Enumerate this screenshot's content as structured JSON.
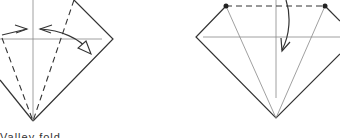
{
  "diagram": {
    "type": "origami-instructions",
    "colors": {
      "line": "#333333",
      "crease": "#888888",
      "background": "#ffffff",
      "point": "#222222"
    },
    "steps": [
      {
        "id": "step-left",
        "description": "Fold both sides to center (valley folds, arrows showing fold directions)"
      },
      {
        "id": "step-right",
        "description": "Fold top down along dashed line between marked points"
      }
    ],
    "caption_partial": "Valley fold"
  }
}
